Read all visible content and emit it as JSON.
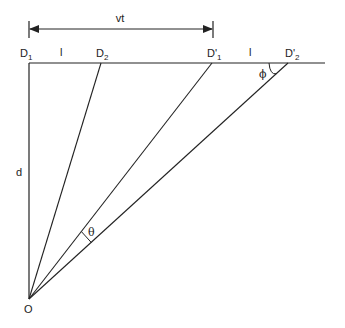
{
  "diagram": {
    "labels": {
      "vt": "vt",
      "d1": "D",
      "d1_sub": "1",
      "d2": "D",
      "d2_sub": "2",
      "d1p": "D'",
      "d1p_sub": "1",
      "d2p": "D'",
      "d2p_sub": "2",
      "l_left": "l",
      "l_right": "l",
      "d": "d",
      "o": "O",
      "theta": "θ",
      "phi": "ϕ"
    },
    "points": {
      "O": [
        29,
        299
      ],
      "D1": [
        29,
        63
      ],
      "D2": [
        101,
        63
      ],
      "D1p": [
        212,
        63
      ],
      "D2p": [
        288,
        63
      ],
      "line_end": [
        325,
        63
      ]
    },
    "dimension_arrow": {
      "from_x": 29,
      "to_x": 213,
      "y": 29,
      "label": "vt"
    },
    "line_color": "#222222"
  }
}
